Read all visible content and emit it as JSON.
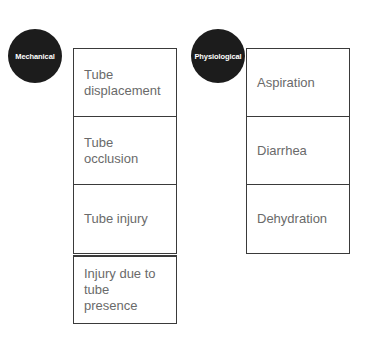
{
  "categories": [
    {
      "label": "Mechanical",
      "items": [
        "Tube displacement",
        "Tube occlusion",
        "Tube injury",
        "Injury due to tube presence"
      ]
    },
    {
      "label": "Physiological",
      "items": [
        "Aspiration",
        "Diarrhea",
        "Dehydration"
      ]
    }
  ],
  "colors": {
    "circle_fill": "#1c1c1c",
    "circle_text": "#ffffff",
    "box_border": "#3a3a3a",
    "box_text": "#6a6a6a"
  }
}
